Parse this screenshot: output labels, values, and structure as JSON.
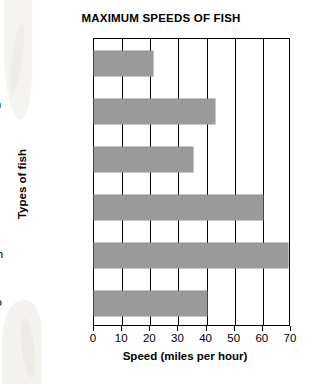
{
  "chart_data": {
    "type": "bar",
    "orientation": "horizontal",
    "title": "MAXIMUM SPEEDS OF FISH",
    "xlabel": "Speed (miles per hour)",
    "ylabel": "Types of fish",
    "categories": [
      "Blue whale",
      "Bluefin tuna",
      "Flying fish",
      "Marlin",
      "Sailfish",
      "Wahoo"
    ],
    "category_lines": [
      [
        "Blue",
        "whale"
      ],
      [
        "Bluefin",
        "tuna"
      ],
      [
        "Flying",
        "fish"
      ],
      [
        "Marlin"
      ],
      [
        "Sailfish"
      ],
      [
        "Wahoo"
      ]
    ],
    "values": [
      21,
      43,
      35,
      60,
      69,
      40
    ],
    "xlim": [
      0,
      70
    ],
    "xticks": [
      0,
      10,
      20,
      30,
      40,
      50,
      60,
      70
    ],
    "xticklabels": [
      "0",
      "10",
      "20",
      "30",
      "40",
      "50",
      "60",
      "70"
    ],
    "grid": "vertical",
    "legend": "none",
    "bar_color": "#9a9a9a",
    "axis_color": "#000000",
    "background": "#ffffff"
  }
}
